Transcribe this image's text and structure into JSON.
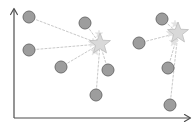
{
  "figure": {
    "title": "",
    "background_color": "#ffffff",
    "width": 195,
    "height": 129
  },
  "axes": {
    "name": "coordinate-axes",
    "color": "#4d4d4d",
    "stroke_width": 1.2,
    "origin": {
      "x": 14,
      "y": 118
    },
    "y_axis": {
      "from_y": 118,
      "to_y": 9,
      "arrow": "up"
    },
    "x_axis": {
      "from_x": 14,
      "to_x": 190,
      "arrow": "right"
    },
    "xlabel": "",
    "ylabel": "",
    "tick_labels": []
  },
  "style": {
    "point_fill": "#9d9d9d",
    "point_stroke": "#6f6f6f",
    "point_stroke_width": 1.0,
    "point_radius": 6,
    "star_fill": "#d9d9d9",
    "star_stroke": "#bdbdbd",
    "star_stroke_width": 0.8,
    "ghost_star_fill": "#e2e2e2",
    "link_color": "#c9c9c9",
    "link_width": 1.0,
    "link_dash": "2,2"
  },
  "chart_data": {
    "type": "scatter",
    "title": "",
    "xlabel": "",
    "ylabel": "",
    "xlim": [
      0,
      195
    ],
    "ylim": [
      0,
      129
    ],
    "grid": false,
    "legend": null,
    "series": [
      {
        "name": "cluster-1-points",
        "marker": "circle",
        "points": [
          {
            "id": "p1",
            "x": 29,
            "y": 17
          },
          {
            "id": "p2",
            "x": 85,
            "y": 23
          },
          {
            "id": "p3",
            "x": 29,
            "y": 50
          },
          {
            "id": "p4",
            "x": 61,
            "y": 67
          },
          {
            "id": "p5",
            "x": 108,
            "y": 70
          },
          {
            "id": "p6",
            "x": 96,
            "y": 95
          }
        ]
      },
      {
        "name": "cluster-2-points",
        "marker": "circle",
        "points": [
          {
            "id": "p7",
            "x": 162,
            "y": 19
          },
          {
            "id": "p8",
            "x": 139,
            "y": 43
          },
          {
            "id": "p9",
            "x": 168,
            "y": 68
          },
          {
            "id": "p10",
            "x": 170,
            "y": 105
          }
        ]
      },
      {
        "name": "centroids",
        "marker": "star",
        "points": [
          {
            "id": "c1",
            "x": 100,
            "y": 44,
            "size": 11
          },
          {
            "id": "c2",
            "x": 178,
            "y": 33,
            "size": 11
          }
        ]
      },
      {
        "name": "centroid-iteration-trail",
        "marker": "star",
        "points": [
          {
            "id": "c1t1",
            "x": 93,
            "y": 43,
            "size": 5
          },
          {
            "id": "c1t2",
            "x": 95,
            "y": 51,
            "size": 5
          },
          {
            "id": "c1t3",
            "x": 99,
            "y": 34,
            "size": 4
          },
          {
            "id": "c2t1",
            "x": 171,
            "y": 33,
            "size": 5
          },
          {
            "id": "c2t2",
            "x": 174,
            "y": 42,
            "size": 5
          },
          {
            "id": "c2t3",
            "x": 175,
            "y": 24,
            "size": 4
          }
        ]
      }
    ],
    "links": [
      {
        "from": "p1",
        "to": "c1"
      },
      {
        "from": "p2",
        "to": "c1"
      },
      {
        "from": "p3",
        "to": "c1"
      },
      {
        "from": "p4",
        "to": "c1"
      },
      {
        "from": "p5",
        "to": "c1"
      },
      {
        "from": "p6",
        "to": "c1"
      },
      {
        "from": "p7",
        "to": "c2"
      },
      {
        "from": "p8",
        "to": "c2"
      },
      {
        "from": "p9",
        "to": "c2"
      },
      {
        "from": "p10",
        "to": "c2"
      }
    ]
  }
}
